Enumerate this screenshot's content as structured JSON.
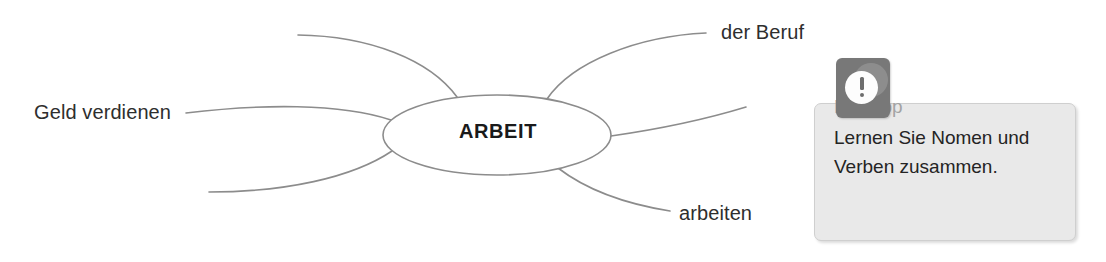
{
  "diagram": {
    "type": "mind-map",
    "center": {
      "label": "ARBEIT",
      "shape": "ellipse"
    },
    "branches": [
      {
        "id": "branch-top-left",
        "label": "",
        "label_position": "none"
      },
      {
        "id": "branch-left",
        "label": "Geld verdienen",
        "label_position": "left"
      },
      {
        "id": "branch-bottom-left",
        "label": "",
        "label_position": "none"
      },
      {
        "id": "branch-top-right",
        "label": "der Beruf",
        "label_position": "right"
      },
      {
        "id": "branch-right",
        "label": "",
        "label_position": "none"
      },
      {
        "id": "branch-bottom-right",
        "label": "arbeiten",
        "label_position": "right"
      }
    ],
    "line_color": "#8c8c8c",
    "text_color": "#2e2e2e"
  },
  "callout": {
    "icon": "exclamation-icon",
    "title": "Lerntipp",
    "body_lines": [
      "Lernen Sie Nomen und",
      "Verben zusammen."
    ],
    "colors": {
      "badge": "#787878",
      "box": "#e9e9e9",
      "box_border": "#cfcfcf",
      "title": "#a3a3a3",
      "body": "#242424"
    }
  }
}
